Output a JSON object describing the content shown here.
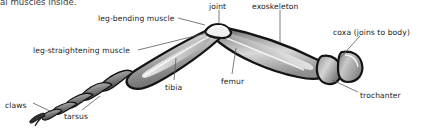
{
  "figure": {
    "title_fragment": "al muscles inside.",
    "background_color": "#ffffff",
    "text_color": "#1c1c1c",
    "leader_line_color": "#555555",
    "outline_color": "#141414",
    "fill_light": "#e8e8e8",
    "fill_mid": "#a8a8a8",
    "fill_dark": "#4a4a4a"
  },
  "labels": [
    {
      "id": "leg-bending-muscle",
      "text": "leg-bending muscle",
      "x": 98,
      "y": 14
    },
    {
      "id": "joint",
      "text": "joint",
      "x": 209,
      "y": 2
    },
    {
      "id": "exoskeleton",
      "text": "exoskeleton",
      "x": 252,
      "y": 2
    },
    {
      "id": "coxa",
      "text": "coxa (joins to body)",
      "x": 333,
      "y": 28
    },
    {
      "id": "leg-straightening-muscle",
      "text": "leg-straightening muscle",
      "x": 33,
      "y": 46
    },
    {
      "id": "tibia",
      "text": "tibia",
      "x": 165,
      "y": 83
    },
    {
      "id": "femur",
      "text": "femur",
      "x": 221,
      "y": 77
    },
    {
      "id": "trochanter",
      "text": "trochanter",
      "x": 360,
      "y": 91
    },
    {
      "id": "claws",
      "text": "claws",
      "x": 5,
      "y": 101
    },
    {
      "id": "tarsus",
      "text": "tarsus",
      "x": 64,
      "y": 112
    }
  ]
}
